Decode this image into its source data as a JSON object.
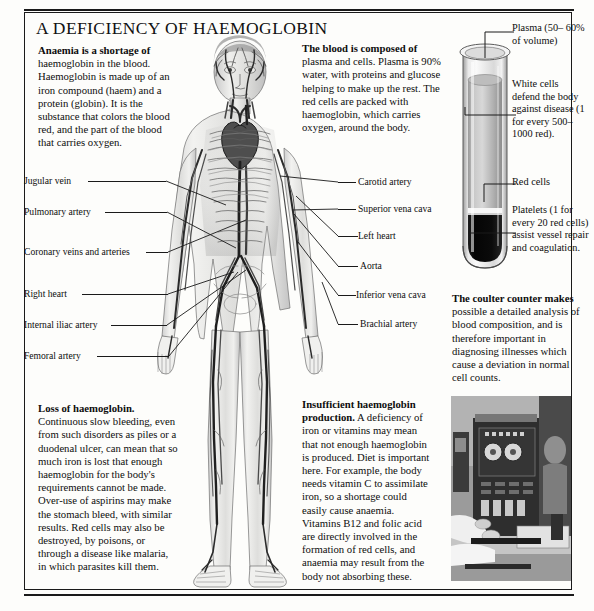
{
  "title": "A DEFICIENCY OF HAEMOGLOBIN",
  "text_blocks": {
    "anaemia": {
      "heading": "Anaemia is a shortage of",
      "body": " haemoglobin in the blood. Haemoglobin is made up of an iron compound (haem) and a protein (globin). It is the substance that colors the blood red, and the part of the blood that carries oxygen."
    },
    "blood_composition": {
      "heading": "The blood is composed of",
      "body": " plasma and cells. Plasma is 90% water, with proteins and glucose helping to make up the rest. The red cells are packed with haemoglobin, which carries oxygen, around the body."
    },
    "loss_of_haemoglobin": {
      "heading": "Loss of haemoglobin.",
      "body": " Continuous slow bleeding, even from such disorders as piles or a duodenal ulcer, can mean that so much iron is lost that enough haemoglobin for the body's requirements cannot be made. Over-use of aspirins may make the stomach bleed, with similar results. Red cells may also be destroyed, by poisons, or through a disease like malaria, in which parasites kill them."
    },
    "insufficient_production": {
      "heading": "Insufficient haemoglobin production.",
      "body": " A deficiency of iron or vitamins may mean that not enough haemoglobin is produced. Diet is important here. For example, the body needs vitamin C to assimilate iron, so a shortage could easily cause anaemia. Vitamins B12 and folic acid are directly involved in the formation of red cells, and anaemia may result from the body not absorbing these."
    },
    "coulter_counter": {
      "heading": "The coulter counter makes",
      "body": " possible a detailed analysis of blood composition, and is therefore important in diagnosing illnesses which cause a deviation in normal cell counts."
    }
  },
  "labels_left": [
    {
      "text": "Jugular vein",
      "top": 178
    },
    {
      "text": "Pulmonary artery",
      "top": 209
    },
    {
      "text": "Coronary veins and  arteries",
      "top": 248
    },
    {
      "text": "Right heart",
      "top": 290
    },
    {
      "text": "Internal iliac artery",
      "top": 321
    },
    {
      "text": "Femoral artery",
      "top": 352
    }
  ],
  "labels_right": [
    {
      "text": "Carotid artery",
      "top": 178
    },
    {
      "text": "Superior vena cava",
      "top": 205
    },
    {
      "text": "Left heart",
      "top": 232
    },
    {
      "text": "Aorta",
      "top": 262
    },
    {
      "text": "Inferior vena cava",
      "top": 291
    },
    {
      "text": "Brachial artery",
      "top": 320
    }
  ],
  "tube_callouts": {
    "plasma": "Plasma (50– 60% of volume)",
    "white_cells": "White cells defend the body against disease (1 for every 500– 1000 red).",
    "red_cells": "Red cells",
    "platelets": "Platelets (1 for every 20 red cells) assist vessel repair and coagulation."
  },
  "colors": {
    "ink": "#1a1a1a",
    "paper": "#fdfdfb",
    "plasma_fill": "#b9b9b9",
    "red_cells_fill": "#0a0a0a",
    "photo_base": "#8d8d8d"
  }
}
